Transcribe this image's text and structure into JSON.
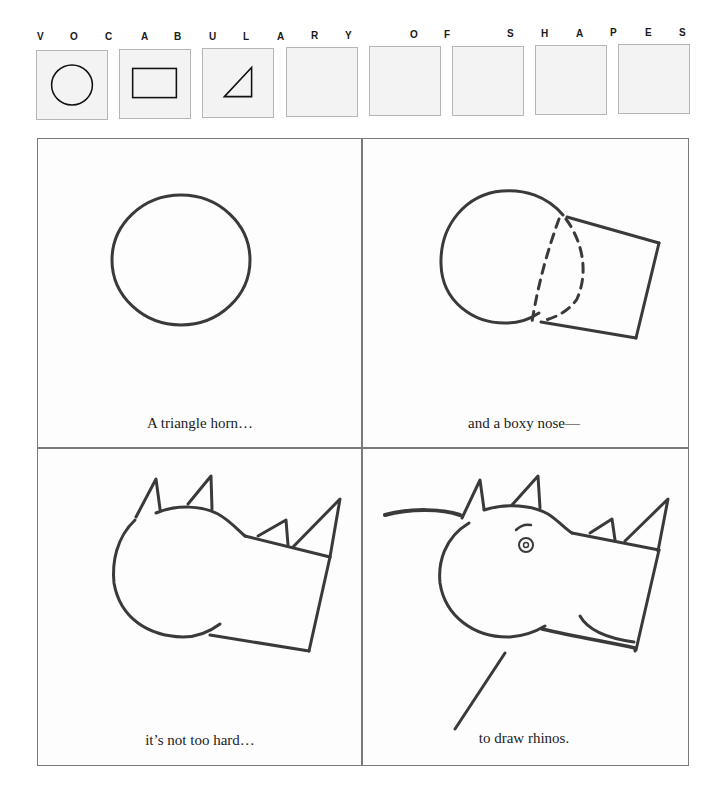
{
  "header": {
    "letters": [
      "V",
      "O",
      "C",
      "A",
      "B",
      "U",
      "L",
      "A",
      "R",
      "Y",
      "O",
      "F",
      "S",
      "H",
      "A",
      "P",
      "E",
      "S"
    ]
  },
  "vocabulary_boxes": [
    {
      "shape": "circle-icon"
    },
    {
      "shape": "rectangle-icon"
    },
    {
      "shape": "triangle-icon"
    },
    {
      "shape": "empty"
    },
    {
      "shape": "empty"
    },
    {
      "shape": "empty"
    },
    {
      "shape": "empty"
    },
    {
      "shape": "empty"
    }
  ],
  "panels": [
    {
      "caption": "A triangle horn…",
      "drawing": "circle"
    },
    {
      "caption": "and a boxy nose—",
      "drawing": "circle-with-box-nose"
    },
    {
      "caption": "it’s not too hard…",
      "drawing": "head-with-horns-and-ears"
    },
    {
      "caption": "to draw rhinos.",
      "drawing": "complete-rhino"
    }
  ],
  "colors": {
    "stroke": "#3a3a3a",
    "border": "#7a7a7a",
    "box_fill": "#f3f3f3"
  }
}
